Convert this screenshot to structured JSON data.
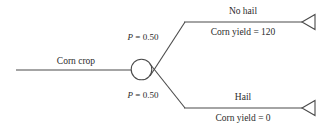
{
  "diagram": {
    "type": "decision-tree",
    "title": "",
    "line_color": "#4a4a4a",
    "text_color": "#2b2b2b",
    "background": "#ffffff",
    "root": {
      "label": "Corn crop",
      "node_type": "chance-node",
      "node_shape": "circle"
    },
    "branches": [
      {
        "id": "no-hail",
        "probability_label": "P = 0.50",
        "probability_var": "P",
        "probability_value": "= 0.50",
        "outcome_label": "No hail",
        "payoff_label": "Corn yield = 120",
        "terminal_shape": "triangle"
      },
      {
        "id": "hail",
        "probability_label": "P = 0.50",
        "probability_var": "P",
        "probability_value": "= 0.50",
        "outcome_label": "Hail",
        "payoff_label": "Corn yield = 0",
        "terminal_shape": "triangle"
      }
    ]
  }
}
